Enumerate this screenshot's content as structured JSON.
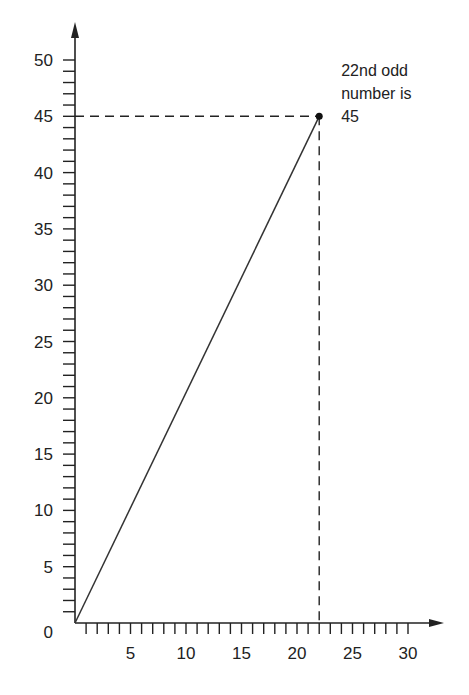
{
  "chart_data": {
    "type": "line",
    "title": "",
    "xlabel": "",
    "ylabel": "",
    "xlim": [
      0,
      30
    ],
    "ylim": [
      0,
      50
    ],
    "grid": false,
    "legend": null,
    "x_ticks": [
      5,
      10,
      15,
      20,
      25,
      30
    ],
    "y_ticks": [
      0,
      5,
      10,
      15,
      20,
      25,
      30,
      35,
      40,
      45,
      50
    ],
    "x_tick_labels": [
      "5",
      "10",
      "15",
      "20",
      "25",
      "30"
    ],
    "y_tick_labels": [
      "0",
      "5",
      "10",
      "15",
      "20",
      "25",
      "30",
      "35",
      "40",
      "45",
      "50"
    ],
    "minor_tick_step": 1,
    "series": [
      {
        "name": "odd numbers",
        "x": [
          0,
          22
        ],
        "y": [
          0,
          45
        ],
        "color": "#333333"
      }
    ],
    "highlight_point": {
      "x": 22,
      "y": 45
    },
    "guides": [
      {
        "type": "horizontal-dashed",
        "y": 45,
        "from_x": 0,
        "to_x": 22
      },
      {
        "type": "vertical-dashed",
        "x": 22,
        "from_y": 0,
        "to_y": 45
      }
    ],
    "annotations": [
      {
        "lines": [
          "22nd odd",
          "number is",
          "45"
        ],
        "anchor_x": 22,
        "anchor_y": 45
      }
    ]
  },
  "axis_color": "#222222",
  "line_color": "#333333"
}
